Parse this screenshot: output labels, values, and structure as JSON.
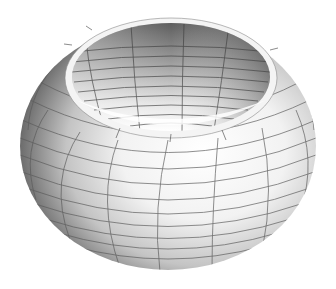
{
  "figure": {
    "background": "#ffffff",
    "colors": {
      "highlight": "#ffffff",
      "mid": "#c8c8c8",
      "shadow": "#6a6a6a",
      "inner_dark": "#5a5a5a",
      "grid": "#555555"
    },
    "body": {
      "cx": 168,
      "cy": 146,
      "rx": 148,
      "ry": 124
    },
    "hole": {
      "cx": 171,
      "cy": 76,
      "rx": 100,
      "ry": 55
    },
    "latitude_lines": 12,
    "meridian_lines": 12
  }
}
